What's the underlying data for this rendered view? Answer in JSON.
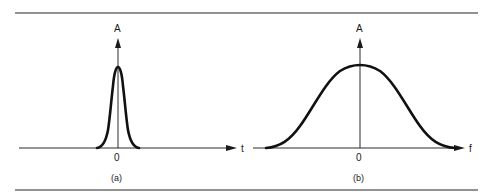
{
  "figure": {
    "panels": [
      {
        "id": "a",
        "caption": "(a)",
        "y_axis_label": "A",
        "x_axis_label": "t",
        "origin_label": "0",
        "description": "Narrow Gaussian pulse in time domain"
      },
      {
        "id": "b",
        "caption": "(b)",
        "y_axis_label": "A",
        "x_axis_label": "f",
        "origin_label": "0",
        "description": "Wide Gaussian spectrum in frequency domain"
      }
    ],
    "colors": {
      "rule": "#6e6e6e",
      "axis": "#2a2a2a",
      "curve": "#111111",
      "background": "#ffffff"
    }
  }
}
